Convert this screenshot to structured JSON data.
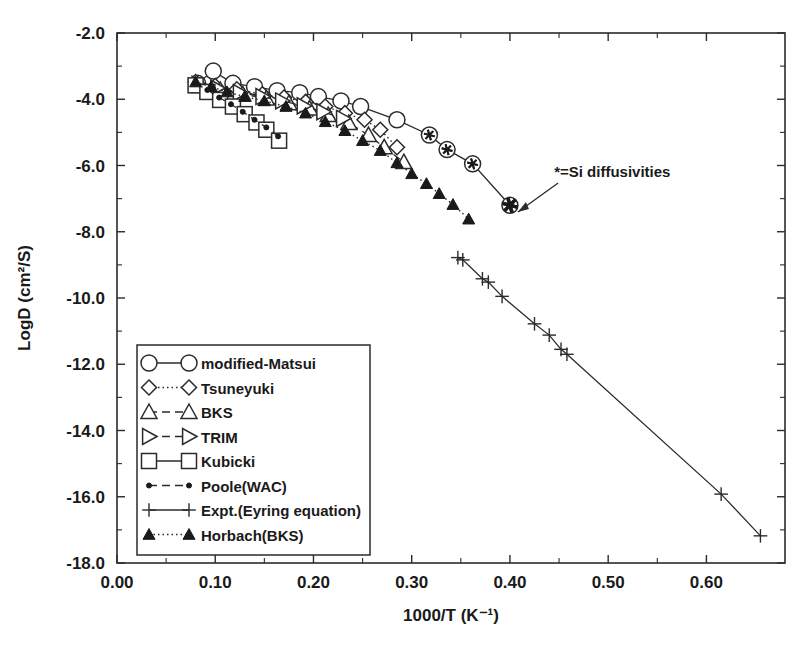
{
  "chart_data": {
    "type": "line",
    "title": "",
    "xlabel": "1000/T (K⁻¹)",
    "ylabel": "LogD (cm²/S)",
    "xlim": [
      0.0,
      0.68
    ],
    "ylim": [
      -18.0,
      -2.0
    ],
    "xticks": [
      0.0,
      0.1,
      0.2,
      0.3,
      0.4,
      0.5,
      0.6
    ],
    "xticklabels": [
      "0.00",
      "0.10",
      "0.20",
      "0.30",
      "0.40",
      "0.50",
      "0.60"
    ],
    "yticks": [
      -2.0,
      -4.0,
      -6.0,
      -8.0,
      -10.0,
      -12.0,
      -14.0,
      -16.0,
      -18.0
    ],
    "yticklabels": [
      "-2.0",
      "-4.0",
      "-6.0",
      "-8.0",
      "-10.0",
      "-12.0",
      "-14.0",
      "-16.0",
      "-18.0"
    ],
    "minor_ticks": true,
    "grid": false,
    "legend_position": "lower-left-inside",
    "annotations": [
      {
        "text": "*=Si diffusivities",
        "x": 0.445,
        "y": -6.35,
        "arrow_to_x": 0.402,
        "arrow_to_y": -7.25
      }
    ],
    "series": [
      {
        "name": "modified-Matsui",
        "marker": "circle-open",
        "linestyle": "solid",
        "points": [
          [
            0.082,
            -3.52
          ],
          [
            0.098,
            -3.15
          ],
          [
            0.118,
            -3.52
          ],
          [
            0.14,
            -3.62
          ],
          [
            0.163,
            -3.74
          ],
          [
            0.186,
            -3.8
          ],
          [
            0.205,
            -3.92
          ],
          [
            0.228,
            -4.05
          ],
          [
            0.248,
            -4.22
          ],
          [
            0.285,
            -4.62
          ],
          [
            0.318,
            -5.08
          ],
          [
            0.336,
            -5.52
          ],
          [
            0.362,
            -5.95
          ],
          [
            0.4,
            -7.2
          ]
        ]
      },
      {
        "name": "Tsuneyuki",
        "marker": "diamond-open",
        "linestyle": "dotted",
        "points": [
          [
            0.08,
            -3.48
          ],
          [
            0.1,
            -3.6
          ],
          [
            0.122,
            -3.7
          ],
          [
            0.148,
            -3.85
          ],
          [
            0.17,
            -3.95
          ],
          [
            0.192,
            -4.08
          ],
          [
            0.212,
            -4.22
          ],
          [
            0.232,
            -4.42
          ],
          [
            0.252,
            -4.62
          ],
          [
            0.268,
            -4.92
          ],
          [
            0.285,
            -5.45
          ]
        ]
      },
      {
        "name": "BKS",
        "marker": "triangle-up-open",
        "linestyle": "dashed",
        "points": [
          [
            0.085,
            -3.6
          ],
          [
            0.105,
            -3.72
          ],
          [
            0.128,
            -3.85
          ],
          [
            0.152,
            -3.98
          ],
          [
            0.175,
            -4.12
          ],
          [
            0.196,
            -4.28
          ],
          [
            0.215,
            -4.48
          ],
          [
            0.236,
            -4.72
          ],
          [
            0.256,
            -5.08
          ],
          [
            0.272,
            -5.45
          ],
          [
            0.292,
            -5.9
          ]
        ]
      },
      {
        "name": "TRIM",
        "marker": "triangle-right-open",
        "linestyle": "dashed",
        "points": [
          [
            0.083,
            -3.55
          ],
          [
            0.102,
            -3.66
          ],
          [
            0.125,
            -3.8
          ],
          [
            0.148,
            -3.92
          ],
          [
            0.168,
            -4.05
          ],
          [
            0.19,
            -4.2
          ],
          [
            0.21,
            -4.38
          ],
          [
            0.23,
            -4.58
          ]
        ]
      },
      {
        "name": "Kubicki",
        "marker": "square-open",
        "linestyle": "solid",
        "points": [
          [
            0.08,
            -3.58
          ],
          [
            0.092,
            -3.78
          ],
          [
            0.105,
            -4.02
          ],
          [
            0.118,
            -4.22
          ],
          [
            0.13,
            -4.45
          ],
          [
            0.142,
            -4.7
          ],
          [
            0.152,
            -4.92
          ],
          [
            0.165,
            -5.25
          ]
        ]
      },
      {
        "name": "Poole(WAC)",
        "marker": "dot-filled",
        "linestyle": "dashed",
        "points": [
          [
            0.08,
            -3.52
          ],
          [
            0.092,
            -3.72
          ],
          [
            0.104,
            -3.95
          ],
          [
            0.116,
            -4.15
          ],
          [
            0.128,
            -4.38
          ],
          [
            0.14,
            -4.62
          ],
          [
            0.152,
            -4.85
          ],
          [
            0.164,
            -5.12
          ]
        ]
      },
      {
        "name": "Expt.(Eyring equation)",
        "marker": "plus",
        "linestyle": "solid",
        "points": [
          [
            0.347,
            -8.78
          ],
          [
            0.352,
            -8.85
          ],
          [
            0.372,
            -9.42
          ],
          [
            0.378,
            -9.52
          ],
          [
            0.392,
            -9.95
          ],
          [
            0.425,
            -10.78
          ],
          [
            0.44,
            -11.12
          ],
          [
            0.452,
            -11.55
          ],
          [
            0.458,
            -11.7
          ],
          [
            0.615,
            -15.92
          ],
          [
            0.655,
            -17.18
          ]
        ]
      },
      {
        "name": "Horbach(BKS)",
        "marker": "triangle-up-filled",
        "linestyle": "dotted",
        "points": [
          [
            0.08,
            -3.48
          ],
          [
            0.096,
            -3.62
          ],
          [
            0.112,
            -3.78
          ],
          [
            0.13,
            -3.92
          ],
          [
            0.15,
            -4.05
          ],
          [
            0.172,
            -4.22
          ],
          [
            0.192,
            -4.42
          ],
          [
            0.212,
            -4.68
          ],
          [
            0.232,
            -4.95
          ],
          [
            0.25,
            -5.25
          ],
          [
            0.268,
            -5.55
          ],
          [
            0.285,
            -5.92
          ],
          [
            0.3,
            -6.25
          ],
          [
            0.315,
            -6.55
          ],
          [
            0.328,
            -6.85
          ],
          [
            0.342,
            -7.18
          ],
          [
            0.358,
            -7.62
          ]
        ]
      }
    ],
    "si_diffusivity_markers": [
      [
        0.318,
        -5.08
      ],
      [
        0.336,
        -5.52
      ],
      [
        0.362,
        -5.95
      ],
      [
        0.4,
        -7.2
      ]
    ],
    "legend": [
      {
        "label": "modified-Matsui",
        "marker": "circle-open",
        "linestyle": "solid"
      },
      {
        "label": "Tsuneyuki",
        "marker": "diamond-open",
        "linestyle": "dotted"
      },
      {
        "label": "BKS",
        "marker": "triangle-up-open",
        "linestyle": "dashed"
      },
      {
        "label": "TRIM",
        "marker": "triangle-right-open",
        "linestyle": "dashed"
      },
      {
        "label": "Kubicki",
        "marker": "square-open",
        "linestyle": "solid"
      },
      {
        "label": "Poole(WAC)",
        "marker": "dot-filled",
        "linestyle": "dashed"
      },
      {
        "label": "Expt.(Eyring equation)",
        "marker": "plus",
        "linestyle": "solid"
      },
      {
        "label": "Horbach(BKS)",
        "marker": "triangle-up-filled",
        "linestyle": "dotted"
      }
    ]
  }
}
